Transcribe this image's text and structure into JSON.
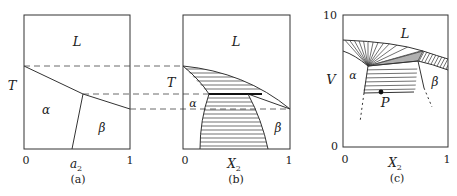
{
  "figure": {
    "panels": [
      {
        "id": "a",
        "caption": "(a)",
        "x_axis": {
          "label": "a",
          "label_sub": "2",
          "ticks": [
            "0",
            "1"
          ]
        },
        "y_axis": {
          "label": "T"
        },
        "regions": [
          "L",
          "α",
          "β"
        ]
      },
      {
        "id": "b",
        "caption": "(b)",
        "x_axis": {
          "label": "X",
          "label_sub": "2",
          "ticks": [
            "0",
            "1"
          ]
        },
        "y_axis": {
          "label": "T"
        },
        "regions": [
          "L",
          "α",
          "β"
        ]
      },
      {
        "id": "c",
        "caption": "(c)",
        "x_axis": {
          "label": "X",
          "label_sub": "2",
          "ticks": [
            "0",
            "1"
          ]
        },
        "y_axis": {
          "label": "V",
          "ticks": [
            "0",
            "10"
          ]
        },
        "regions": [
          "L",
          "α",
          "β"
        ],
        "point": "P"
      }
    ]
  }
}
